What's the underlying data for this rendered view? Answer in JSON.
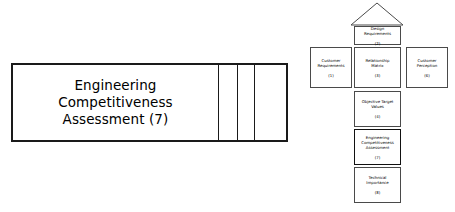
{
  "callout": {
    "label": "Engineering Competitiveness Assessment (7)",
    "dividers": [
      205,
      224,
      241
    ],
    "border_color": "#1a1a1a"
  },
  "diagram": {
    "type": "house-of-quality",
    "roof": {
      "name": "correlation-roof",
      "label": ""
    },
    "boxes": [
      {
        "id": "design-requirements",
        "title": "Design\nRequirements",
        "number": "(2)",
        "emphasis": false
      },
      {
        "id": "customer-requirements",
        "title": "Customer\nRequirements",
        "number": "(1)",
        "emphasis": false
      },
      {
        "id": "relationship-matrix",
        "title": "Relationship\nMatrix",
        "number": "(3)",
        "emphasis": false
      },
      {
        "id": "customer-perception",
        "title": "Customer\nPerception",
        "number": "(6)",
        "emphasis": false
      },
      {
        "id": "objective-target-values",
        "title": "Objective Target\nValues",
        "number": "(4)",
        "emphasis": false
      },
      {
        "id": "engineering-competitiveness-assessment",
        "title": "Engineering\nCompetitiveness\nAssessment",
        "number": "(7)",
        "emphasis": true
      },
      {
        "id": "technical-importance",
        "title": "Technical\nImportance",
        "number": "(8)",
        "emphasis": false
      }
    ]
  },
  "boxes_by_id": {
    "design": {
      "title": "Design\nRequirements",
      "number": "(2)"
    },
    "custreq": {
      "title": "Customer\nRequirements",
      "number": "(1)"
    },
    "relmatrix": {
      "title": "Relationship\nMatrix",
      "number": "(3)"
    },
    "custperc": {
      "title": "Customer\nPerception",
      "number": "(6)"
    },
    "objtarget": {
      "title": "Objective Target\nValues",
      "number": "(4)"
    },
    "engcomp": {
      "title": "Engineering\nCompetitiveness\nAssessment",
      "number": "(7)"
    },
    "techimp": {
      "title": "Technical\nImportance",
      "number": "(8)"
    }
  }
}
